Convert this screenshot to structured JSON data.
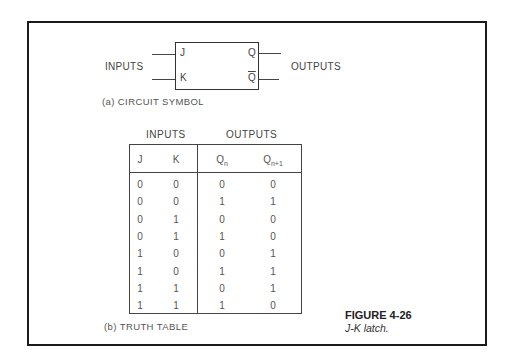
{
  "figure": {
    "number": "FIGURE 4-26",
    "title": "J-K latch."
  },
  "circuit_symbol": {
    "caption": "(a) CIRCUIT SYMBOL",
    "inputs_label": "INPUTS",
    "outputs_label": "OUTPUTS",
    "pins": {
      "j": "J",
      "k": "K",
      "q": "Q",
      "q_bar": "Q"
    }
  },
  "truth_table": {
    "caption": "(b) TRUTH TABLE",
    "group_headers": [
      "INPUTS",
      "OUTPUTS"
    ],
    "columns": [
      {
        "base": "J",
        "sub": ""
      },
      {
        "base": "K",
        "sub": ""
      },
      {
        "base": "Q",
        "sub": "n"
      },
      {
        "base": "Q",
        "sub": "n+1"
      }
    ],
    "rows": [
      [
        "0",
        "0",
        "0",
        "0"
      ],
      [
        "0",
        "0",
        "1",
        "1"
      ],
      [
        "0",
        "1",
        "0",
        "0"
      ],
      [
        "0",
        "1",
        "1",
        "0"
      ],
      [
        "1",
        "0",
        "0",
        "1"
      ],
      [
        "1",
        "0",
        "1",
        "1"
      ],
      [
        "1",
        "1",
        "0",
        "1"
      ],
      [
        "1",
        "1",
        "1",
        "0"
      ]
    ]
  }
}
